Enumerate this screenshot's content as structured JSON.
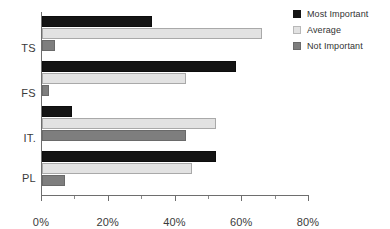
{
  "chart_data": {
    "type": "bar",
    "orientation": "horizontal",
    "title": "",
    "subtitle": "",
    "xlabel": "",
    "ylabel": "",
    "categories": [
      "TS",
      "FS",
      "IT.",
      "PL"
    ],
    "series": [
      {
        "name": "Most Important",
        "color": "#141414",
        "values": [
          33,
          58,
          9,
          52
        ]
      },
      {
        "name": "Average",
        "color": "#e2e2e2",
        "values": [
          66,
          43,
          52,
          45
        ]
      },
      {
        "name": "Not Important",
        "color": "#7e7e7e",
        "values": [
          4,
          2,
          43,
          7
        ]
      }
    ],
    "xlim": [
      0,
      80
    ],
    "xticks": [
      0,
      20,
      40,
      60,
      80
    ],
    "xtick_labels": [
      "0%",
      "20%",
      "40%",
      "60%",
      "80%"
    ],
    "xminor_ticks": [
      10,
      30,
      50,
      70
    ],
    "grid": false,
    "legend_position": "top-right"
  },
  "legend": {
    "entries": [
      {
        "label": "Most Important",
        "swatch": "most-important-swatch"
      },
      {
        "label": "Average",
        "swatch": "average-swatch"
      },
      {
        "label": "Not Important",
        "swatch": "not-important-swatch"
      }
    ]
  },
  "axes": {
    "category_labels": [
      "TS",
      "FS",
      "IT.",
      "PL"
    ],
    "x_tick_labels": [
      "0%",
      "20%",
      "40%",
      "60%",
      "80%"
    ]
  }
}
